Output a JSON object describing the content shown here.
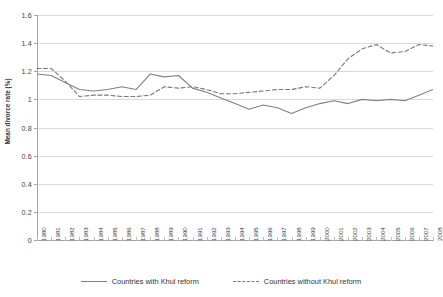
{
  "chart_data": {
    "type": "line",
    "title": "",
    "xlabel": "",
    "ylabel": "Mean divorce rate (%)",
    "ylim": [
      0,
      1.6
    ],
    "ytick_values": [
      "0",
      "0.2",
      "0.4",
      "0.6",
      "0.8",
      "1",
      "1.2",
      "1.4",
      "1.6"
    ],
    "grid": true,
    "legend_position": "bottom",
    "categories": [
      "1980",
      "1981",
      "1982",
      "1983",
      "1984",
      "1985",
      "1986",
      "1987",
      "1988",
      "1989",
      "1990",
      "1991",
      "1992",
      "1993",
      "1994",
      "1995",
      "1996",
      "1997",
      "1998",
      "1999",
      "2000",
      "2001",
      "2002",
      "2003",
      "2004",
      "2005",
      "2006",
      "2007",
      "2008"
    ],
    "series": [
      {
        "name": "Countries with Khul reform",
        "style": "solid",
        "color": "#808080",
        "values": [
          1.18,
          1.17,
          1.12,
          1.07,
          1.06,
          1.07,
          1.09,
          1.07,
          1.18,
          1.16,
          1.17,
          1.08,
          1.05,
          1.01,
          0.97,
          0.93,
          0.96,
          0.94,
          0.9,
          0.94,
          0.97,
          0.99,
          0.97,
          1.0,
          0.99,
          1.0,
          0.99,
          1.03,
          1.07
        ]
      },
      {
        "name": "Countries without Khul reform",
        "style": "dashed",
        "color": "#7a7a7a",
        "values": [
          1.22,
          1.22,
          1.13,
          1.02,
          1.03,
          1.03,
          1.02,
          1.02,
          1.03,
          1.09,
          1.08,
          1.09,
          1.07,
          1.04,
          1.04,
          1.05,
          1.06,
          1.07,
          1.07,
          1.09,
          1.08,
          1.17,
          1.29,
          1.36,
          1.39,
          1.33,
          1.34,
          1.39,
          1.38
        ]
      }
    ]
  },
  "legend": {
    "items": [
      {
        "label": "Countries with Khul reform",
        "style": "solid"
      },
      {
        "label": "Countries without Khul reform",
        "style": "dashed"
      }
    ]
  },
  "axes": {
    "y_title": "Mean divorce rate (%)"
  }
}
